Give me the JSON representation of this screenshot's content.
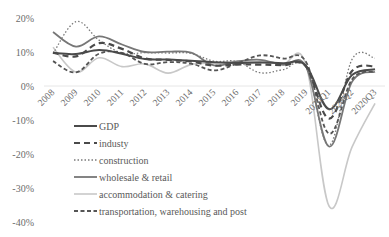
{
  "chart_data": {
    "type": "line",
    "title": "",
    "xlabel": "",
    "ylabel": "",
    "ylim": [
      -40,
      20
    ],
    "yticks": [
      "20%",
      "10%",
      "0%",
      "-10%",
      "-20%",
      "-30%",
      "-40%"
    ],
    "ytick_values": [
      20,
      10,
      0,
      -10,
      -20,
      -30,
      -40
    ],
    "grid": false,
    "zero_line": true,
    "legend_position": "inside-lower-left",
    "categories": [
      "2008",
      "2009",
      "2010",
      "2011",
      "2012",
      "2013",
      "2014",
      "2015",
      "2016",
      "2017",
      "2018",
      "2019",
      "2020Q1",
      "2020Q2",
      "2020Q3"
    ],
    "series": [
      {
        "name": "GDP",
        "style": "solid",
        "color": "#4a4a4a",
        "width": 2,
        "values": [
          9.7,
          9.4,
          10.6,
          9.5,
          7.9,
          7.8,
          7.4,
          7.0,
          6.8,
          6.9,
          6.7,
          6.0,
          -6.8,
          3.2,
          4.9
        ]
      },
      {
        "name": "industy",
        "style": "dashed",
        "color": "#4a4a4a",
        "width": 2.2,
        "values": [
          9.9,
          8.7,
          12.6,
          10.9,
          8.1,
          7.7,
          7.2,
          6.0,
          6.3,
          6.3,
          6.1,
          5.7,
          -9.6,
          4.4,
          5.8
        ]
      },
      {
        "name": "construction",
        "style": "dotted",
        "color": "#7a7a7a",
        "width": 1.3,
        "values": [
          9.5,
          18.9,
          13.5,
          9.7,
          9.8,
          9.7,
          9.6,
          7.3,
          7.2,
          3.9,
          4.8,
          5.6,
          -17.5,
          7.8,
          8.2
        ]
      },
      {
        "name": "wholesale & retail",
        "style": "solid",
        "color": "#777777",
        "width": 1.8,
        "values": [
          15.9,
          11.6,
          14.6,
          12.2,
          10.0,
          10.1,
          9.8,
          6.1,
          7.2,
          7.7,
          6.2,
          5.7,
          -17.8,
          1.2,
          4.2
        ]
      },
      {
        "name": "accommodation & catering",
        "style": "solid",
        "color": "#c8c8c8",
        "width": 1.6,
        "values": [
          11.4,
          4.1,
          8.3,
          5.7,
          6.5,
          3.8,
          6.3,
          6.8,
          7.3,
          7.1,
          6.5,
          6.3,
          -35.3,
          -18.0,
          -5.1
        ]
      },
      {
        "name": "transportation, warehousing and post",
        "style": "longdash",
        "color": "#555555",
        "width": 1.8,
        "values": [
          7.3,
          4.0,
          9.5,
          9.7,
          6.5,
          7.0,
          6.6,
          4.6,
          6.6,
          9.0,
          8.1,
          7.1,
          -14.0,
          1.9,
          4.3
        ]
      }
    ]
  },
  "legend": {
    "items": [
      {
        "label": "GDP"
      },
      {
        "label": "industy"
      },
      {
        "label": "construction"
      },
      {
        "label": "wholesale & retail"
      },
      {
        "label": "accommodation & catering"
      },
      {
        "label": "transportation, warehousing and post"
      }
    ]
  }
}
